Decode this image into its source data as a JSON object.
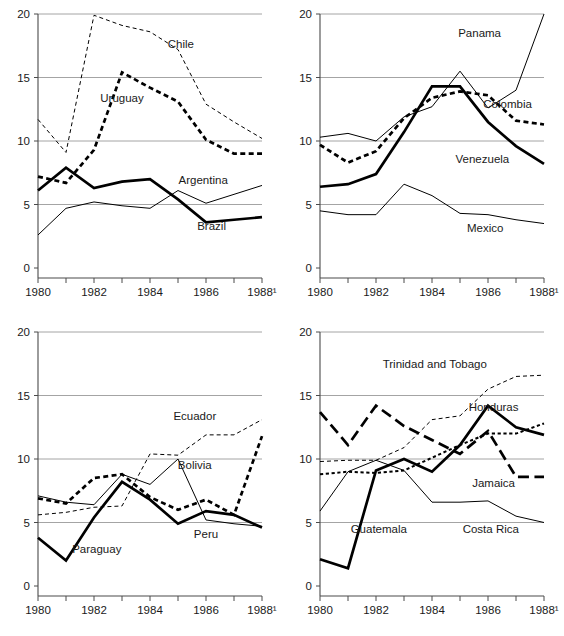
{
  "figure": {
    "title": "",
    "panel_count": 4,
    "axis": {
      "ylim": [
        0,
        20
      ],
      "yticks": [
        0,
        5,
        10,
        15,
        20
      ],
      "ytick_labels": [
        "0",
        "5",
        "10",
        "15",
        "20"
      ],
      "xlim": [
        1980,
        1988
      ],
      "xticks": [
        1980,
        1981,
        1982,
        1983,
        1984,
        1985,
        1986,
        1987,
        1988
      ],
      "xtick_labels": [
        "1980",
        "",
        "1982",
        "",
        "1984",
        "",
        "1986",
        "",
        "1988¹"
      ],
      "grid": "horizontal",
      "footnote_marker": "¹"
    }
  },
  "chart_data": [
    {
      "id": "panel-top-left",
      "type": "line",
      "title": "",
      "xlabel": "",
      "ylabel": "",
      "xlim": [
        1980,
        1988
      ],
      "ylim": [
        0,
        20
      ],
      "grid": "horizontal gridlines at 5, 10, 15, 20",
      "legend": "inline series labels",
      "x": [
        1980,
        1981,
        1982,
        1983,
        1984,
        1985,
        1986,
        1987,
        1988
      ],
      "series": [
        {
          "name": "Chile",
          "style": "fine-dashed",
          "label_x": 1985.1,
          "label_y": 17.3,
          "values": [
            11.7,
            9.1,
            19.9,
            19.1,
            18.6,
            17.2,
            12.9,
            11.5,
            10.2
          ]
        },
        {
          "name": "Uruguay",
          "style": "thick-dotted",
          "label_x": 1983.0,
          "label_y": 13.1,
          "values": [
            7.2,
            6.7,
            9.3,
            15.4,
            14.2,
            13.1,
            10.1,
            9.0,
            9.0
          ]
        },
        {
          "name": "Argentina",
          "style": "thin-solid",
          "label_x": 1985.9,
          "label_y": 6.6,
          "values": [
            2.6,
            4.7,
            5.2,
            4.9,
            4.7,
            6.1,
            5.1,
            5.8,
            6.5
          ]
        },
        {
          "name": "Brazil",
          "style": "thick-solid",
          "label_x": 1986.2,
          "label_y": 3.0,
          "values": [
            6.1,
            7.9,
            6.3,
            6.8,
            7.0,
            5.4,
            3.6,
            3.8,
            4.0
          ]
        }
      ]
    },
    {
      "id": "panel-top-right",
      "type": "line",
      "title": "",
      "xlabel": "",
      "ylabel": "",
      "xlim": [
        1980,
        1988
      ],
      "ylim": [
        0,
        20
      ],
      "grid": "horizontal gridlines at 5, 10, 15, 20",
      "legend": "inline series labels",
      "x": [
        1980,
        1981,
        1982,
        1983,
        1984,
        1985,
        1986,
        1987,
        1988
      ],
      "series": [
        {
          "name": "Panama",
          "style": "thin-solid",
          "label_x": 1985.7,
          "label_y": 18.2,
          "values": [
            10.3,
            10.6,
            10.0,
            11.9,
            12.7,
            15.5,
            12.6,
            14.0,
            20.0
          ]
        },
        {
          "name": "Colombia",
          "style": "thick-dotted",
          "label_x": 1986.7,
          "label_y": 12.6,
          "values": [
            9.7,
            8.3,
            9.2,
            11.8,
            13.4,
            13.9,
            13.6,
            11.6,
            11.3
          ]
        },
        {
          "name": "Venezuela",
          "style": "thick-solid",
          "label_x": 1985.8,
          "label_y": 8.3,
          "values": [
            6.4,
            6.6,
            7.4,
            10.7,
            14.3,
            14.3,
            11.5,
            9.6,
            8.2
          ]
        },
        {
          "name": "Mexico",
          "style": "thin-solid",
          "label_x": 1985.9,
          "label_y": 2.8,
          "values": [
            4.5,
            4.2,
            4.2,
            6.6,
            5.7,
            4.3,
            4.2,
            3.8,
            3.5
          ]
        }
      ]
    },
    {
      "id": "panel-bottom-left",
      "type": "line",
      "title": "",
      "xlabel": "",
      "ylabel": "",
      "xlim": [
        1980,
        1988
      ],
      "ylim": [
        0,
        20
      ],
      "grid": "horizontal gridlines at 5, 10, 15, 20",
      "legend": "inline series labels",
      "x": [
        1980,
        1981,
        1982,
        1983,
        1984,
        1985,
        1986,
        1987,
        1988
      ],
      "series": [
        {
          "name": "Ecuador",
          "style": "fine-dashed",
          "label_x": 1985.6,
          "label_y": 13.1,
          "values": [
            5.6,
            5.8,
            6.2,
            6.3,
            10.4,
            10.3,
            11.9,
            11.9,
            13.1
          ]
        },
        {
          "name": "Bolivia",
          "style": "thick-dotted",
          "label_x": 1985.6,
          "label_y": 9.2,
          "values": [
            6.9,
            6.5,
            8.5,
            8.8,
            7.0,
            6.0,
            6.8,
            5.6,
            11.8
          ]
        },
        {
          "name": "Peru",
          "style": "thin-solid",
          "label_x": 1986.0,
          "label_y": 3.8,
          "values": [
            7.1,
            6.6,
            6.4,
            8.8,
            8.0,
            10.0,
            5.2,
            4.9,
            4.7
          ]
        },
        {
          "name": "Paraguay",
          "style": "thick-solid",
          "label_x": 1982.1,
          "label_y": 2.6,
          "values": [
            3.8,
            2.0,
            5.4,
            8.2,
            6.8,
            4.9,
            5.9,
            5.6,
            4.6
          ]
        }
      ]
    },
    {
      "id": "panel-bottom-right",
      "type": "line",
      "title": "",
      "xlabel": "",
      "ylabel": "",
      "xlim": [
        1980,
        1988
      ],
      "ylim": [
        0,
        20
      ],
      "grid": "horizontal gridlines at 5, 10, 15, 20",
      "legend": "inline series labels",
      "x": [
        1980,
        1981,
        1982,
        1983,
        1984,
        1985,
        1986,
        1987,
        1988
      ],
      "series": [
        {
          "name": "Trinidad and Tobago",
          "style": "fine-dashed",
          "label_x": 1984.1,
          "label_y": 17.2,
          "values": [
            9.8,
            9.9,
            9.9,
            10.9,
            13.1,
            13.4,
            15.5,
            16.5,
            16.6
          ]
        },
        {
          "name": "Honduras",
          "style": "fine-dotted",
          "label_x": 1986.2,
          "label_y": 13.8,
          "values": [
            8.8,
            9.0,
            8.9,
            9.1,
            10.1,
            11.1,
            12.0,
            12.0,
            12.8
          ]
        },
        {
          "name": "Jamaica",
          "style": "long-dashed",
          "label_x": 1986.2,
          "label_y": 7.8,
          "values": [
            13.7,
            11.1,
            14.2,
            12.6,
            11.5,
            10.4,
            12.2,
            8.6,
            8.6
          ]
        },
        {
          "name": "Guatemala",
          "style": "thick-solid",
          "label_x": 1982.1,
          "label_y": 4.2,
          "values": [
            2.1,
            1.4,
            9.1,
            10.0,
            9.0,
            11.1,
            14.2,
            12.5,
            11.9
          ]
        },
        {
          "name": "Costa Rica",
          "style": "thin-solid",
          "label_x": 1986.1,
          "label_y": 4.2,
          "values": [
            5.9,
            9.0,
            9.9,
            9.1,
            6.6,
            6.6,
            6.7,
            5.5,
            5.0
          ]
        }
      ]
    }
  ]
}
